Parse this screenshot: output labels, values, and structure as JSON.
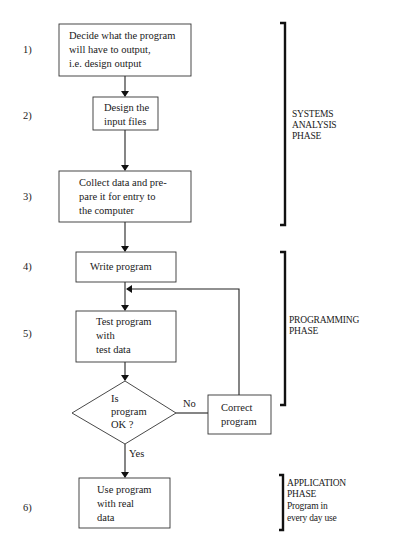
{
  "steps": [
    {
      "number": "1)",
      "lines": [
        "Decide what the program",
        "will have to output,",
        "i.e. design output"
      ]
    },
    {
      "number": "2)",
      "lines": [
        "Design the",
        "input files"
      ]
    },
    {
      "number": "3)",
      "lines": [
        "Collect data and pre-",
        "pare it for entry to",
        "the computer"
      ]
    },
    {
      "number": "4)",
      "lines": [
        "Write program"
      ]
    },
    {
      "number": "5)",
      "lines": [
        "Test program",
        "with",
        "test data"
      ]
    },
    {
      "number": "6)",
      "lines": [
        "Use program",
        "with real",
        "data"
      ]
    }
  ],
  "decision": {
    "lines": [
      "Is",
      "program",
      "OK ?"
    ],
    "no_label": "No",
    "yes_label": "Yes"
  },
  "correct_box": {
    "lines": [
      "Correct",
      "program"
    ]
  },
  "phases": {
    "systems": {
      "lines": [
        "SYSTEMS",
        "ANALYSIS",
        "PHASE"
      ]
    },
    "programming": {
      "lines": [
        "PROGRAMMING",
        "PHASE"
      ]
    },
    "application": {
      "lines": [
        "APPLICATION",
        "PHASE",
        "Program in",
        "every day use"
      ]
    }
  }
}
